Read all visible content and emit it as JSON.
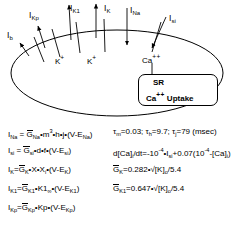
{
  "figure": {
    "type": "cell-ionic-current-diagram",
    "title": "",
    "membrane_shape": "ellipse",
    "currents": [
      {
        "id": "Ib",
        "label": "I",
        "sub": "b",
        "x": 7,
        "y": 32,
        "arrow": "inward"
      },
      {
        "id": "IKp",
        "label": "I",
        "sub": "Kp",
        "x": 31,
        "y": 12,
        "arrow": "outward"
      },
      {
        "id": "IK1",
        "label": "I",
        "sub": "K1",
        "x": 72,
        "y": 5,
        "arrow": "outward"
      },
      {
        "id": "IK",
        "label": "I",
        "sub": "K",
        "x": 104,
        "y": 5,
        "arrow": "outward"
      },
      {
        "id": "INa",
        "label": "I",
        "sub": "Na",
        "x": 130,
        "y": 7,
        "arrow": "inward"
      },
      {
        "id": "Isi",
        "label": "I",
        "sub": "si",
        "x": 168,
        "y": 14,
        "arrow": "inward"
      }
    ],
    "ion_labels": [
      {
        "id": "k-plus-1",
        "text": "K",
        "sup": "+",
        "x": 58,
        "y": 58
      },
      {
        "id": "k-plus-2",
        "text": "K",
        "sup": "+",
        "x": 90,
        "y": 58
      },
      {
        "id": "ca-plus-2",
        "text": "Ca",
        "sup": "++",
        "x": 144,
        "y": 57
      }
    ],
    "sr_box": {
      "title": "SR",
      "caption": "Ca",
      "caption_sup": "++",
      "caption_tail": " Uptake",
      "arrow": "down"
    }
  },
  "equations": {
    "rows": [
      {
        "id": "eq-ina",
        "left": {
          "lhs_i": "I",
          "lhs_sub": "Na",
          "rhs": "=G̅<sub>Na</sub>•m<sup>3</sup>•h•j•(V-E<sub>Na</sub>)"
        },
        "right": "τ<sub>m</sub>=0.03; τ<sub>h</sub>=9.7; τ<sub>j</sub>=79 (msec)"
      },
      {
        "id": "eq-isi",
        "left": {
          "lhs_i": "I",
          "lhs_sub": "si",
          "rhs": "=G̅<sub>si</sub>•d•f•(V-E<sub>si</sub>)"
        },
        "right": "d[Ca]<sub>i</sub>/dt=-10<sup>-4</sup>•I<sub>si</sub>+0.07(10<sup>-4</sup>-[Ca]<sub>i</sub>)"
      },
      {
        "id": "eq-ik",
        "left": {
          "lhs_i": "I",
          "lhs_sub": "K",
          "rhs": "=G̅<sub>K</sub>•X•X<sub>i</sub>•(V-E<sub>K</sub>)"
        },
        "right": "G̅<sub>K</sub>=0.282•√[K]<sub>o</sub>/5.4"
      },
      {
        "id": "eq-ik1",
        "left": {
          "lhs_i": "I",
          "lhs_sub": "K1",
          "rhs": "=G̅<sub>K1</sub>•K1<sub>∞</sub>•(V-E<sub>K1</sub>)"
        },
        "right": "G̅<sub>K1</sub>=0.647•√[K]<sub>o</sub>/5.4"
      },
      {
        "id": "eq-ikp",
        "left": {
          "lhs_i": "I",
          "lhs_sub": "Kp",
          "rhs": "=G̅<sub>Kp</sub>•Kp•(V-E<sub>Kp</sub>)"
        },
        "right": ""
      }
    ],
    "plain_text": [
      "I_Na = G_Na*m^3*h*j*(V-E_Na)    tau_m=0.03; tau_h=9.7; tau_j=79 (msec)",
      "I_si = G_si*d*f*(V-E_si)        d[Ca]i/dt=-10^-4*I_si+0.07(10^-4-[Ca]i)",
      "I_K = G_K*X*Xi*(V-E_K)          G_K=0.282*sqrt([K]o/5.4)",
      "I_K1 = G_K1*K1inf*(V-E_K1)      G_K1=0.647*sqrt([K]o/5.4)",
      "I_Kp = G_Kp*Kp*(V-E_Kp)"
    ]
  },
  "colors": {
    "ink": "#000000",
    "background": "#ffffff"
  }
}
